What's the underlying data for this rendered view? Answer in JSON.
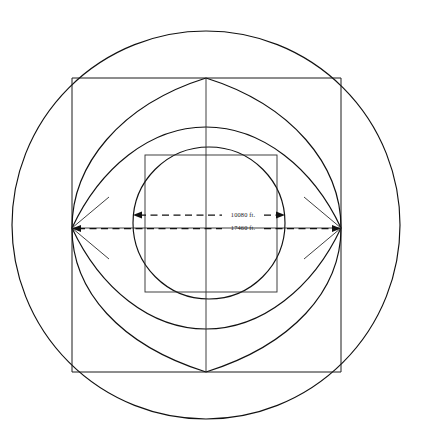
{
  "figure": {
    "background_color": "#ffffff",
    "line_color": "#111111",
    "width": 423,
    "height": 443
  },
  "dimensions": [
    {
      "id": "inner-dimension",
      "label": "10080 ft.",
      "span_px": 152,
      "y_px": 215,
      "x_start_px": 133,
      "x_end_px": 285,
      "style": "dashed-double-arrow",
      "describes": "inner circle diameter"
    },
    {
      "id": "outer-dimension",
      "label": "17460 ft.",
      "span_px": 269,
      "y_px": 228,
      "x_start_px": 72,
      "x_end_px": 341,
      "style": "dashed-double-arrow",
      "describes": "square width / vesica span"
    }
  ],
  "shapes": {
    "outer_circle": {
      "cx": 206,
      "cy": 225,
      "r": 194
    },
    "outer_square": {
      "x": 72,
      "y": 78,
      "width": 269,
      "height": 294
    },
    "inner_circle": {
      "cx": 209,
      "cy": 223,
      "r": 76
    },
    "inner_square": {
      "x": 145,
      "y": 155,
      "width": 132,
      "height": 137
    },
    "vesica_points": {
      "top": {
        "x": 206,
        "y": 78
      },
      "bottom": {
        "x": 206,
        "y": 372
      },
      "left": {
        "x": 72,
        "y": 228
      },
      "right": {
        "x": 341,
        "y": 228
      }
    },
    "axes": {
      "vertical_x": 206,
      "horizontal_y": 228
    }
  },
  "units": "ft."
}
